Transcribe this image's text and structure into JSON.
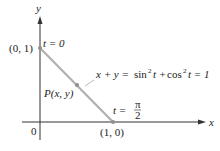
{
  "diagram": {
    "axes": {
      "x_label": "x",
      "y_label": "y",
      "origin_label": "0"
    },
    "points": {
      "start": {
        "label": "(0, 1)",
        "param": "t = 0"
      },
      "end": {
        "label": "(1, 0)",
        "param_t": "t =",
        "param_num": "π",
        "param_den": "2"
      },
      "moving": {
        "label": "P(x, y)"
      }
    },
    "equation": {
      "lhs": "x + y =",
      "sin": "sin",
      "sup1": "2",
      "t1": "t +",
      "cos": "cos",
      "sup2": "2",
      "t2": "t = 1"
    },
    "colors": {
      "axis": "#333333",
      "segment": "#b0b0b0",
      "point": "#909090"
    }
  }
}
